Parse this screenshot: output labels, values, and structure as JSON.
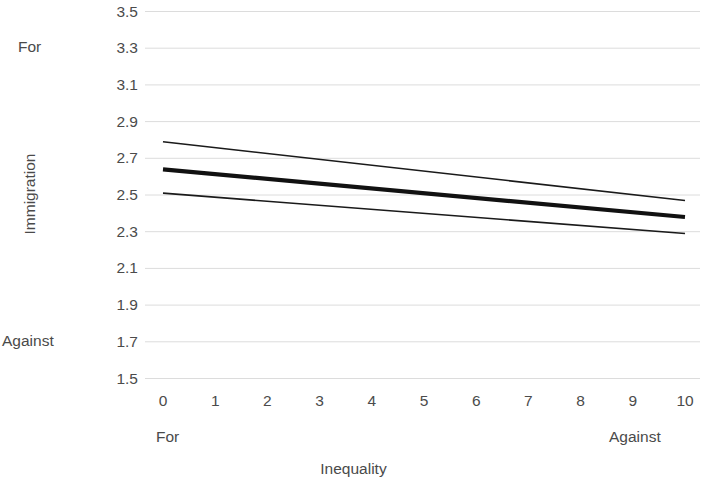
{
  "chart_data": {
    "type": "line",
    "title": "",
    "xlabel": "Inequality",
    "ylabel": "Immigration",
    "xlim": [
      0,
      10
    ],
    "ylim": [
      1.5,
      3.5
    ],
    "grid": true,
    "legend_position": "none",
    "x": [
      0,
      10
    ],
    "x_tick_labels": [
      "0",
      "1",
      "2",
      "3",
      "4",
      "5",
      "6",
      "7",
      "8",
      "9",
      "10"
    ],
    "x_tick_values": [
      0,
      1,
      2,
      3,
      4,
      5,
      6,
      7,
      8,
      9,
      10
    ],
    "y_tick_labels": [
      "3.5",
      "3.3",
      "3.1",
      "2.9",
      "2.7",
      "2.5",
      "2.3",
      "2.1",
      "1.9",
      "1.7",
      "1.5"
    ],
    "y_tick_values": [
      3.5,
      3.3,
      3.1,
      2.9,
      2.7,
      2.5,
      2.3,
      2.1,
      1.9,
      1.7,
      1.5
    ],
    "x_pole_low_label": "For",
    "x_pole_high_label": "Against",
    "y_pole_high_label": "For",
    "y_pole_low_label": "Against",
    "y_pole_high_value": 3.3,
    "y_pole_low_value": 1.7,
    "series": [
      {
        "name": "upper-confidence-bound",
        "style": "thin",
        "color": "#1a1a1a",
        "width": 1.6,
        "x": [
          0,
          10
        ],
        "values": [
          2.79,
          2.47
        ]
      },
      {
        "name": "predicted-estimate",
        "style": "thick",
        "color": "#111111",
        "width": 4.2,
        "x": [
          0,
          10
        ],
        "values": [
          2.64,
          2.38
        ]
      },
      {
        "name": "lower-confidence-bound",
        "style": "thin",
        "color": "#1a1a1a",
        "width": 1.6,
        "x": [
          0,
          10
        ],
        "values": [
          2.51,
          2.29
        ]
      }
    ],
    "colors": {
      "gridline": "#dcdcdc",
      "line": "#111111",
      "text": "#4a4a4a",
      "background": "#ffffff"
    }
  }
}
